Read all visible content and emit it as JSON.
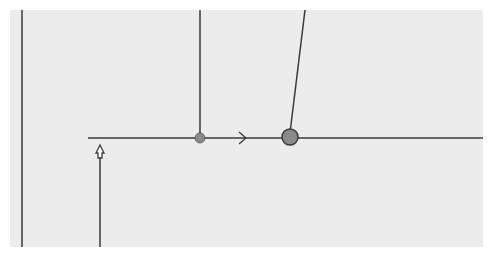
{
  "diagram": {
    "type": "connector-routing-illustration",
    "colors": {
      "background": "#ececec",
      "page": "#ffffff",
      "line": "#3a3a3a",
      "junction_fill": "#8a8a8a",
      "ghost_text": "#d9d9d9"
    },
    "canvas": {
      "x": 10,
      "y": 10,
      "width": 473,
      "height": 237
    },
    "lines": [
      {
        "id": "left-vertical",
        "x1": 22,
        "y1": 10,
        "x2": 22,
        "y2": 247
      },
      {
        "id": "mid-vertical",
        "x1": 200,
        "y1": 10,
        "x2": 200,
        "y2": 138
      },
      {
        "id": "slanted",
        "x1": 305,
        "y1": 10,
        "x2": 290,
        "y2": 133
      },
      {
        "id": "horizontal-main",
        "x1": 88,
        "y1": 138,
        "x2": 483,
        "y2": 138
      },
      {
        "id": "lower-vertical",
        "x1": 100,
        "y1": 158,
        "x2": 100,
        "y2": 247
      }
    ],
    "junctions": [
      {
        "id": "small-dot",
        "cx": 200,
        "cy": 138,
        "r": 5
      },
      {
        "id": "large-circle",
        "cx": 290,
        "cy": 137,
        "r": 8
      }
    ],
    "arrows": [
      {
        "id": "direction-arrow",
        "type": "open-chevron",
        "x": 243,
        "y": 138,
        "direction": "right"
      },
      {
        "id": "hollow-up-arrow",
        "type": "hollow-head",
        "x": 100,
        "y": 145,
        "direction": "up"
      }
    ],
    "ghost_text_lines": []
  }
}
